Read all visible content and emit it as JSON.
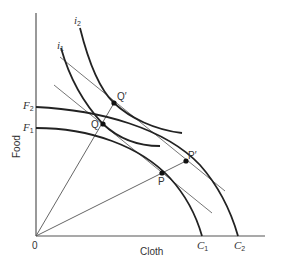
{
  "diagram": {
    "type": "economics-ppf-indifference",
    "axes": {
      "x_label": "Cloth",
      "y_label": "Food",
      "origin_label": "0"
    },
    "production_frontiers": [
      {
        "id": "F1C1",
        "start_label": "F",
        "start_sub": "1",
        "end_label": "C",
        "end_sub": "1"
      },
      {
        "id": "F2C2",
        "start_label": "F",
        "start_sub": "2",
        "end_label": "C",
        "end_sub": "2"
      }
    ],
    "indifference_curves": [
      {
        "id": "i1",
        "label": "i",
        "sub": "1"
      },
      {
        "id": "i2",
        "label": "i",
        "sub": "2"
      }
    ],
    "points": [
      {
        "id": "Q",
        "label": "Q"
      },
      {
        "id": "Q_prime",
        "label": "Q′"
      },
      {
        "id": "P",
        "label": "P"
      },
      {
        "id": "P_prime",
        "label": "P′"
      }
    ],
    "colors": {
      "curve": "#222222",
      "line": "#555555",
      "text": "#333333"
    }
  }
}
